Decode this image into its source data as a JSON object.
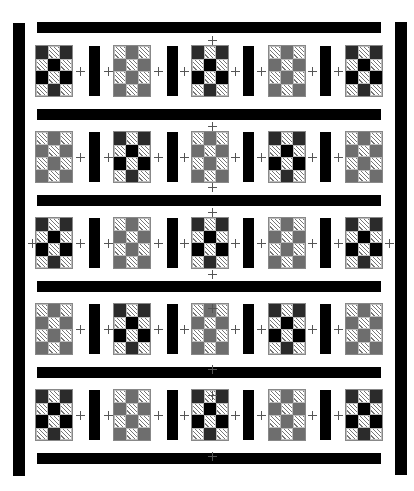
{
  "colors": {
    "background": "#ffffff",
    "sashing": "#000000",
    "black": "#000000",
    "dark": "#2b2b2b",
    "gray": "#6e6e6e",
    "hatch_line": "#777777"
  },
  "patterns": {
    "dark_block": [
      [
        "dark",
        "hatch",
        "dark"
      ],
      [
        "hatch",
        "black",
        "hatch"
      ],
      [
        "black",
        "hatch",
        "black"
      ],
      [
        "hatch",
        "dark",
        "hatch"
      ]
    ],
    "gray_block": [
      [
        "hatch",
        "gray",
        "hatch"
      ],
      [
        "gray",
        "hatch",
        "gray"
      ],
      [
        "hatch",
        "gray",
        "hatch"
      ],
      [
        "gray",
        "hatch",
        "gray"
      ]
    ]
  },
  "layout": {
    "block_x": [
      35,
      113,
      191,
      268,
      345
    ],
    "block_y": [
      45,
      131,
      217,
      303,
      389
    ],
    "block_w": 38,
    "block_h": 52,
    "vsash_x": [
      89,
      167,
      243,
      320
    ],
    "vsash_w": 11,
    "hbar_y": [
      22,
      109,
      195,
      281,
      367,
      453
    ],
    "hbar_x": 37,
    "hbar_w": 344,
    "hbar_h": 11,
    "left_border": {
      "x": 13,
      "y": 23,
      "w": 12,
      "h": 453
    },
    "right_border": {
      "x": 395,
      "y": 22,
      "w": 12,
      "h": 453
    }
  },
  "rows": [
    [
      "dark_block",
      "gray_block",
      "dark_block",
      "gray_block",
      "dark_block"
    ],
    [
      "gray_block",
      "dark_block",
      "gray_block",
      "dark_block",
      "gray_block"
    ],
    [
      "dark_block",
      "gray_block",
      "dark_block",
      "gray_block",
      "dark_block"
    ],
    [
      "gray_block",
      "dark_block",
      "gray_block",
      "dark_block",
      "gray_block"
    ],
    [
      "dark_block",
      "gray_block",
      "dark_block",
      "gray_block",
      "dark_block"
    ]
  ],
  "plus_marks": [
    [
      80,
      71
    ],
    [
      108,
      71
    ],
    [
      158,
      71
    ],
    [
      184,
      71
    ],
    [
      235,
      71
    ],
    [
      261,
      71
    ],
    [
      312,
      71
    ],
    [
      338,
      71
    ],
    [
      212,
      40
    ],
    [
      80,
      157
    ],
    [
      108,
      157
    ],
    [
      158,
      157
    ],
    [
      184,
      157
    ],
    [
      235,
      157
    ],
    [
      261,
      157
    ],
    [
      312,
      157
    ],
    [
      338,
      157
    ],
    [
      212,
      126
    ],
    [
      212,
      187
    ],
    [
      32,
      243
    ],
    [
      80,
      243
    ],
    [
      108,
      243
    ],
    [
      158,
      243
    ],
    [
      184,
      243
    ],
    [
      235,
      243
    ],
    [
      261,
      243
    ],
    [
      312,
      243
    ],
    [
      338,
      243
    ],
    [
      389,
      243
    ],
    [
      212,
      212
    ],
    [
      212,
      274
    ],
    [
      80,
      329
    ],
    [
      108,
      329
    ],
    [
      158,
      329
    ],
    [
      184,
      329
    ],
    [
      235,
      329
    ],
    [
      261,
      329
    ],
    [
      312,
      329
    ],
    [
      338,
      329
    ],
    [
      212,
      308
    ],
    [
      212,
      369
    ],
    [
      80,
      415
    ],
    [
      108,
      415
    ],
    [
      158,
      415
    ],
    [
      184,
      415
    ],
    [
      235,
      415
    ],
    [
      261,
      415
    ],
    [
      312,
      415
    ],
    [
      338,
      415
    ],
    [
      212,
      395
    ],
    [
      212,
      456
    ]
  ]
}
